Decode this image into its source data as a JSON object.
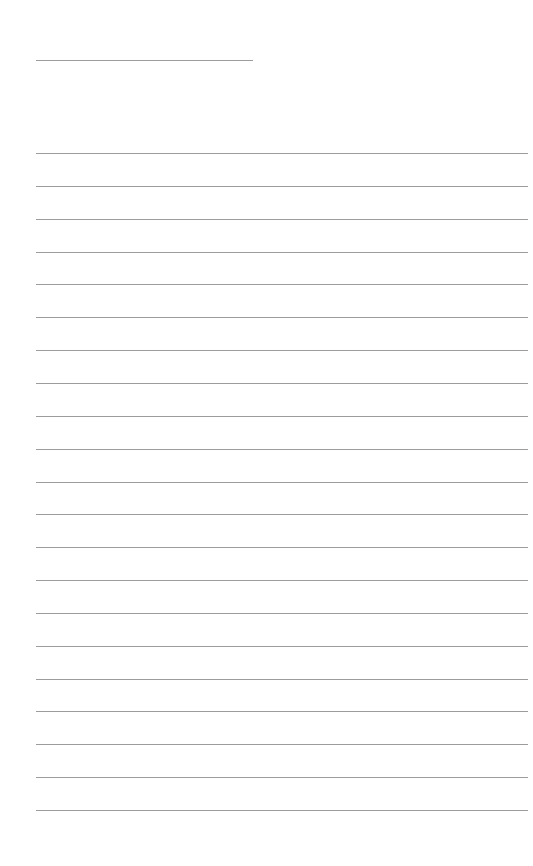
{
  "page": {
    "type": "blank lined paper",
    "background_color": "#ffffff",
    "line_color": "#9c9c9c"
  },
  "header_line": {
    "left": 36,
    "top": 60,
    "width": 217
  },
  "ruled_lines": {
    "count": 21,
    "left": 36,
    "width": 492,
    "first_top": 153,
    "spacing": 32.85
  }
}
